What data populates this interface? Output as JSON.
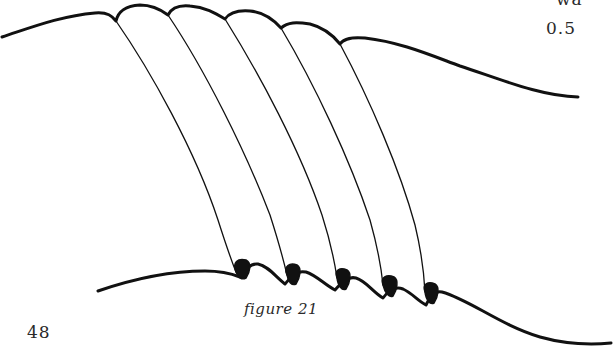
{
  "page": {
    "number": "48",
    "margin_fragment_top": "wa",
    "margin_fragment_value": "0.5"
  },
  "figure": {
    "caption": "figure 21",
    "fold_count": 5,
    "stroke_color": "#111111"
  }
}
